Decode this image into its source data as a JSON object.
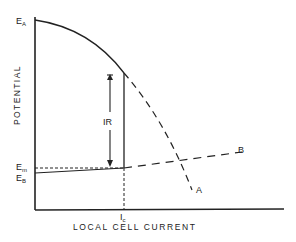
{
  "diagram": {
    "axes": {
      "x_label": "LOCAL CELL CURRENT",
      "y_label": "POTENTIAL"
    },
    "labels": {
      "ea_main": "E",
      "ea_sub": "A",
      "em_main": "E",
      "em_sub": "m",
      "eb_main": "E",
      "eb_sub": "B",
      "ic_main": "I",
      "ic_sub": "c",
      "ir": "IR",
      "curve_a": "A",
      "curve_b": "B"
    },
    "colors": {
      "line": "#222222",
      "background": "#ffffff"
    }
  }
}
